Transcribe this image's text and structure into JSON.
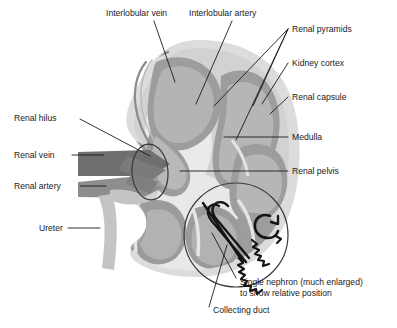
{
  "diagram": {
    "subject": "kidney",
    "background_color": "#ffffff",
    "colors": {
      "capsule": "#dcdcdc",
      "cortex": "#d0d0d0",
      "medulla_pyramid": "#9a9a9a",
      "pelvis": "#e4e4e4",
      "renal_vein": "#6e6e6e",
      "renal_artery": "#888888",
      "ureter": "#c2c2c2",
      "nephron_line": "#141414",
      "leader_line": "#1a1a1a",
      "text": "#1a1a1a"
    },
    "labels": [
      {
        "id": "interlobular-vein",
        "text": "Interlobular vein",
        "x": 106,
        "y": 16,
        "anchor": "start"
      },
      {
        "id": "interlobular-artery",
        "text": "Interlobular artery",
        "x": 189,
        "y": 16,
        "anchor": "start"
      },
      {
        "id": "renal-pyramids",
        "text": "Renal pyramids",
        "x": 292,
        "y": 32,
        "anchor": "start"
      },
      {
        "id": "kidney-cortex",
        "text": "Kidney cortex",
        "x": 292,
        "y": 66,
        "anchor": "start"
      },
      {
        "id": "renal-capsule",
        "text": "Renal capsule",
        "x": 292,
        "y": 100,
        "anchor": "start"
      },
      {
        "id": "medulla",
        "text": "Medulla",
        "x": 292,
        "y": 140,
        "anchor": "start"
      },
      {
        "id": "renal-pelvis",
        "text": "Renal pelvis",
        "x": 292,
        "y": 174,
        "anchor": "start"
      },
      {
        "id": "renal-hilus",
        "text": "Renal hilus",
        "x": 14,
        "y": 121,
        "anchor": "start"
      },
      {
        "id": "renal-vein",
        "text": "Renal vein",
        "x": 14,
        "y": 158,
        "anchor": "start"
      },
      {
        "id": "renal-artery",
        "text": "Renal artery",
        "x": 14,
        "y": 189,
        "anchor": "start"
      },
      {
        "id": "ureter",
        "text": "Ureter",
        "x": 39,
        "y": 231,
        "anchor": "start"
      },
      {
        "id": "single-nephron-line1",
        "text": "Single nephron (much enlarged)",
        "x": 240,
        "y": 285,
        "anchor": "start"
      },
      {
        "id": "single-nephron-line2",
        "text": "to show relative position",
        "x": 240,
        "y": 296,
        "anchor": "start"
      },
      {
        "id": "collecting-duct",
        "text": "Collecting duct",
        "x": 213,
        "y": 313,
        "anchor": "start"
      }
    ]
  }
}
